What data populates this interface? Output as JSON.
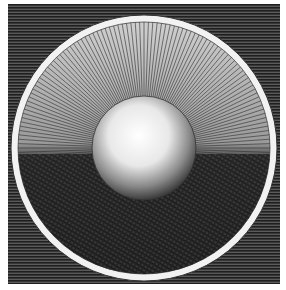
{
  "image": {
    "description": "Engraving of a luminous sphere inside a circular field with radiating lines, upper half light and lower half darkly crosshatched, set on a horizontally hatched dark square background",
    "colors": {
      "background": "#ffffff",
      "hatch_dark": "#2b2b2b",
      "ring": "#f4f4f4",
      "rays": "#3a3a3a",
      "sphere_light": "#f8f8f8",
      "lower_dark": "#1e1e1e"
    }
  }
}
